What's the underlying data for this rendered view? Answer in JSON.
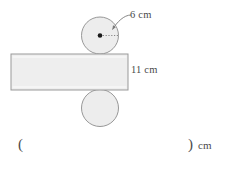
{
  "figure": {
    "name": "cylinder-dimension-figure",
    "shapes": {
      "top_circle": {
        "name": "top-circle",
        "cx": 100,
        "cy": 35.5,
        "r": 18.5,
        "fill": "#ededed",
        "stroke": "#8c8c8c"
      },
      "bottom_circle": {
        "name": "bottom-circle",
        "cx": 100,
        "cy": 108,
        "r": 18.5,
        "fill": "#ededed",
        "stroke": "#8c8c8c"
      },
      "rectangle": {
        "name": "middle-rectangle",
        "x": 11,
        "y": 54,
        "width": 117,
        "height": 36,
        "fill": "#eeeeee",
        "stroke": "#999999"
      },
      "center_dot": {
        "name": "circle-center-dot",
        "cx": 100,
        "cy": 35.5,
        "r": 2.2,
        "fill": "#1a1a1a"
      },
      "radius_line": {
        "name": "radius-dotted-line",
        "x1": 100,
        "y1": 35.5,
        "x2": 118,
        "y2": 35.5,
        "stroke": "#7a7a7a",
        "dash": "1.2 1.6"
      },
      "leader_arrow": {
        "name": "radius-leader-arrow",
        "x1": 132,
        "y1": 16,
        "x2": 113,
        "y2": 30,
        "stroke": "#7a7a7a"
      }
    },
    "labels": {
      "radius": "6 cm",
      "height": "11 cm"
    }
  },
  "answer": {
    "open_paren": "(",
    "close_paren": ")",
    "unit": "cm",
    "value": "",
    "placeholder": ""
  },
  "colors": {
    "shape_fill": "#ededed",
    "shape_stroke": "#8c8c8c",
    "rect_fill": "#eeeeee",
    "rect_stroke": "#999999",
    "text": "#4a4a4a",
    "background": "#ffffff"
  }
}
